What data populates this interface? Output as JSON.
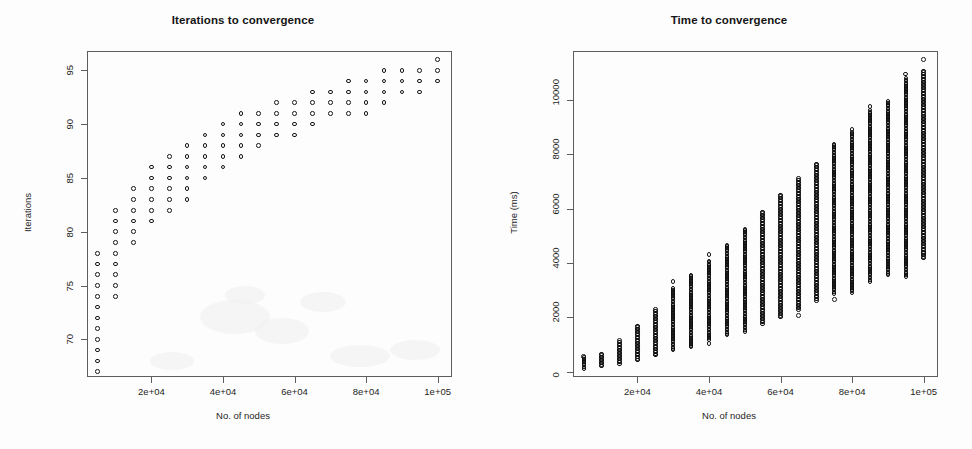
{
  "figure": {
    "width": 972,
    "height": 449,
    "background": "#fdfdfd",
    "axis_color": "#5d5d5d",
    "point_color": "#161616"
  },
  "panels": [
    {
      "id": "iterations",
      "title": "Iterations to convergence",
      "xlabel": "No. of nodes",
      "ylabel": "Iterations"
    },
    {
      "id": "time",
      "title": "Time to convergence",
      "xlabel": "No. of nodes",
      "ylabel": "Time (ms)"
    }
  ],
  "chart_data": [
    {
      "type": "scatter",
      "title": "Iterations to convergence",
      "xlabel": "No. of nodes",
      "ylabel": "Iterations",
      "xlim": [
        2000,
        104000
      ],
      "ylim": [
        66.5,
        96.8
      ],
      "xticks": [
        20000,
        40000,
        60000,
        80000,
        100000
      ],
      "xticklabels": [
        "2e+04",
        "4e+04",
        "6e+04",
        "8e+04",
        "1e+05"
      ],
      "yticks": [
        70,
        75,
        80,
        85,
        90,
        95
      ],
      "yticklabels": [
        "70",
        "75",
        "80",
        "85",
        "90",
        "95"
      ],
      "grid": false,
      "legend": "none",
      "marker": "open-circle",
      "description": "Integer iteration counts per node-count group; each x group is a discrete column of achievable iteration values rising and saturating near 92-96.",
      "columns": [
        {
          "x": 5000,
          "y": [
            67,
            68,
            69,
            70,
            71,
            72,
            73,
            74,
            75,
            76,
            77,
            78
          ]
        },
        {
          "x": 10000,
          "y": [
            74,
            75,
            76,
            77,
            78,
            79,
            80,
            81,
            82
          ]
        },
        {
          "x": 15000,
          "y": [
            79,
            80,
            81,
            82,
            83,
            84
          ]
        },
        {
          "x": 20000,
          "y": [
            81,
            82,
            83,
            84,
            85,
            86
          ]
        },
        {
          "x": 25000,
          "y": [
            82,
            83,
            84,
            85,
            86,
            87
          ]
        },
        {
          "x": 30000,
          "y": [
            83,
            84,
            85,
            86,
            87,
            88
          ]
        },
        {
          "x": 35000,
          "y": [
            85,
            86,
            87,
            88,
            89
          ]
        },
        {
          "x": 40000,
          "y": [
            86,
            87,
            88,
            89,
            90
          ]
        },
        {
          "x": 45000,
          "y": [
            87,
            88,
            89,
            90,
            91
          ]
        },
        {
          "x": 50000,
          "y": [
            88,
            89,
            90,
            91
          ]
        },
        {
          "x": 55000,
          "y": [
            89,
            90,
            91,
            92
          ]
        },
        {
          "x": 60000,
          "y": [
            89,
            90,
            91,
            92
          ]
        },
        {
          "x": 65000,
          "y": [
            90,
            91,
            92,
            93
          ]
        },
        {
          "x": 70000,
          "y": [
            91,
            92,
            93
          ]
        },
        {
          "x": 75000,
          "y": [
            91,
            92,
            93,
            94
          ]
        },
        {
          "x": 80000,
          "y": [
            91,
            92,
            93,
            94
          ]
        },
        {
          "x": 85000,
          "y": [
            92,
            93,
            94,
            95
          ]
        },
        {
          "x": 90000,
          "y": [
            93,
            94,
            95
          ]
        },
        {
          "x": 95000,
          "y": [
            93,
            94,
            95
          ]
        },
        {
          "x": 100000,
          "y": [
            94,
            95,
            96
          ]
        }
      ]
    },
    {
      "type": "scatter",
      "title": "Time to convergence",
      "xlabel": "No. of nodes",
      "ylabel": "Time (ms)",
      "xlim": [
        2000,
        104000
      ],
      "ylim": [
        -200,
        11800
      ],
      "xticks": [
        20000,
        40000,
        60000,
        80000,
        100000
      ],
      "xticklabels": [
        "2e+04",
        "4e+04",
        "6e+04",
        "8e+04",
        "1e+05"
      ],
      "yticks": [
        0,
        2000,
        4000,
        6000,
        8000,
        10000
      ],
      "yticklabels": [
        "0",
        "2000",
        "4000",
        "6000",
        "8000",
        "10000"
      ],
      "grid": false,
      "legend": "none",
      "marker": "open-circle",
      "description": "Dense vertical strips of run times per node count; the band of times grows roughly linearly with node count from a few hundred ms up to about 11000 ms.",
      "columns": [
        {
          "x": 5000,
          "ymin": 120,
          "ymax": 520,
          "outlier_high": 560
        },
        {
          "x": 10000,
          "ymin": 200,
          "ymax": 640
        },
        {
          "x": 15000,
          "ymin": 290,
          "ymax": 1080,
          "outlier_high": 1150
        },
        {
          "x": 20000,
          "ymin": 430,
          "ymax": 1680
        },
        {
          "x": 25000,
          "ymin": 600,
          "ymax": 2280
        },
        {
          "x": 30000,
          "ymin": 800,
          "ymax": 3060,
          "outlier_high": 3320
        },
        {
          "x": 35000,
          "ymin": 900,
          "ymax": 3560
        },
        {
          "x": 40000,
          "ymin": 1180,
          "ymax": 4080,
          "outlier_low": 1030,
          "outlier_high": 4300
        },
        {
          "x": 45000,
          "ymin": 1350,
          "ymax": 4660
        },
        {
          "x": 50000,
          "ymin": 1480,
          "ymax": 5250
        },
        {
          "x": 55000,
          "ymin": 1760,
          "ymax": 5880
        },
        {
          "x": 60000,
          "ymin": 2000,
          "ymax": 6500
        },
        {
          "x": 65000,
          "ymin": 2280,
          "ymax": 7100,
          "outlier_low": 2060
        },
        {
          "x": 70000,
          "ymin": 2620,
          "ymax": 7640
        },
        {
          "x": 75000,
          "ymin": 2880,
          "ymax": 8380,
          "outlier_low": 2660
        },
        {
          "x": 80000,
          "ymin": 2900,
          "ymax": 8800,
          "outlier_high": 8920
        },
        {
          "x": 85000,
          "ymin": 3320,
          "ymax": 9620,
          "outlier_high": 9760
        },
        {
          "x": 90000,
          "ymin": 3560,
          "ymax": 9940
        },
        {
          "x": 95000,
          "ymin": 3500,
          "ymax": 10800,
          "outlier_high": 10960
        },
        {
          "x": 100000,
          "ymin": 4180,
          "ymax": 11060,
          "outlier_low": 4380,
          "outlier_high": 11480
        }
      ]
    }
  ]
}
